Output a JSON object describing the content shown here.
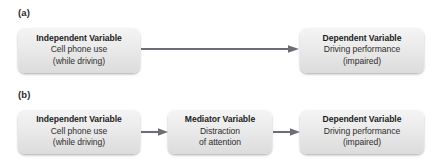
{
  "figure": {
    "panels": [
      {
        "label": "(a)",
        "boxes": [
          {
            "role": "independent-variable",
            "title": "Independent Variable",
            "line2": "Cell phone use",
            "line3": "(while driving)"
          },
          {
            "role": "dependent-variable",
            "title": "Dependent Variable",
            "line2": "Driving performance",
            "line3": "(impaired)"
          }
        ],
        "arrows": [
          {
            "name": "arrow-iv-to-dv",
            "direction": "right"
          }
        ]
      },
      {
        "label": "(b)",
        "boxes": [
          {
            "role": "independent-variable",
            "title": "Independent Variable",
            "line2": "Cell phone use",
            "line3": "(while driving)"
          },
          {
            "role": "mediator-variable",
            "title": "Mediator Variable",
            "line2": "Distraction",
            "line3": "of attention"
          },
          {
            "role": "dependent-variable",
            "title": "Dependent Variable",
            "line2": "Driving performance",
            "line3": "(impaired)"
          }
        ],
        "arrows": [
          {
            "name": "arrow-iv-to-mv",
            "direction": "right"
          },
          {
            "name": "arrow-mv-to-dv",
            "direction": "right"
          }
        ]
      }
    ],
    "colors": {
      "background": "#ffffff",
      "box_fill_top": "#f4f4f4",
      "box_fill_bottom": "#dcdcdc",
      "title_text": "#1d1d1d",
      "body_text": "#2e2e2e",
      "arrow": "#6b6f75"
    }
  }
}
